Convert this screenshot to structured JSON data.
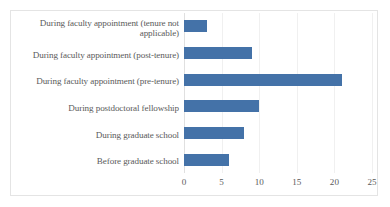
{
  "chart_data": {
    "type": "bar",
    "orientation": "horizontal",
    "title": "",
    "subtitle": "",
    "xlabel": "",
    "ylabel": "",
    "categories": [
      "During faculty appointment (tenure not applicable)",
      "During faculty appointment (post-tenure)",
      "During faculty appointment (pre-tenure)",
      "During postdoctoral fellowship",
      "During graduate school",
      "Before graduate school"
    ],
    "values": [
      3,
      9,
      21,
      10,
      8,
      6
    ],
    "series": [
      {
        "name": "",
        "values": [
          3,
          9,
          21,
          10,
          8,
          6
        ]
      }
    ],
    "xlim": [
      0,
      25
    ],
    "xticks": [
      0,
      5,
      10,
      15,
      20,
      25
    ],
    "xtick_labels": [
      "0",
      "5",
      "10",
      "15",
      "20",
      "25"
    ],
    "grid": true,
    "grid_axis": "x",
    "legend": false,
    "legend_position": "none",
    "bar_color": "#4472a8",
    "gridline_color": "#f0f0f0",
    "axis_color": "#e0e0e0",
    "label_color": "#5a5a5a",
    "border_color": "#e4e4e4",
    "background": "#ffffff"
  }
}
